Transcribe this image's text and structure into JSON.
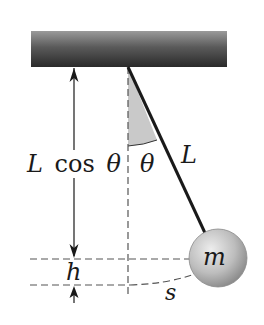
{
  "diagram": {
    "labels": {
      "vertical_component": "L cos θ",
      "vertical_component_L": "L",
      "vertical_component_cos": "cos",
      "vertical_component_theta": "θ",
      "angle": "θ",
      "length": "L",
      "height": "h",
      "arc": "s",
      "mass": "m"
    },
    "colors": {
      "ceiling_dark": "#2e2e2e",
      "ceiling_light": "#9a9a9a",
      "rod": "#1a1a1a",
      "dashed": "#555555",
      "wedge": "#c8c8c8",
      "ball_light": "#e6e6e6",
      "ball_dark": "#8a8a8a"
    },
    "geometry": {
      "ceiling": {
        "x": 31,
        "y": 31,
        "width": 196,
        "height": 36
      },
      "pivot": {
        "x": 128,
        "y": 67
      },
      "ball": {
        "cx": 218,
        "cy": 258,
        "r": 29
      },
      "vertical_dim_x": 74,
      "h_top_y": 259,
      "h_bottom_y": 285
    }
  }
}
